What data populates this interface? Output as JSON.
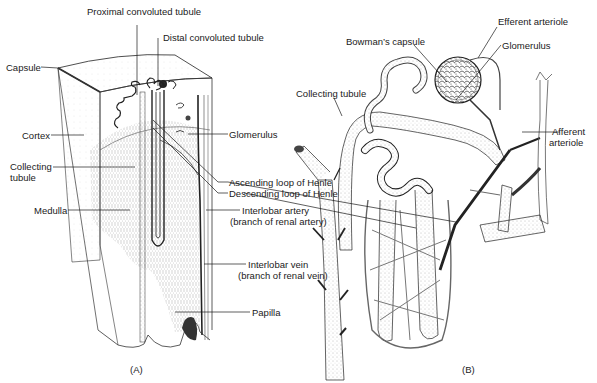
{
  "figure": {
    "panels": [
      {
        "id": "A",
        "label": "(A)",
        "description": "Cutaway of a kidney lobe showing cortex, medulla and nephron arrangement"
      },
      {
        "id": "B",
        "label": "(B)",
        "description": "Single nephron with its blood supply"
      }
    ]
  },
  "panel_a": {
    "labels": {
      "proximal_convoluted_tubule": "Proximal convoluted tubule",
      "distal_convoluted_tubule": "Distal convoluted tubule",
      "capsule": "Capsule",
      "cortex": "Cortex",
      "glomerulus": "Glomerulus",
      "collecting_tubule_line1": "Collecting",
      "collecting_tubule_line2": "tubule",
      "ascending_loop": "Ascending loop of Henle",
      "descending_loop": "Descending loop of Henle",
      "medulla": "Medulla",
      "interlobar_artery_line1": "Interlobar artery",
      "interlobar_artery_line2": "(branch of renal artery)",
      "interlobar_vein_line1": "Interlobar vein",
      "interlobar_vein_line2": "(branch of renal vein)",
      "papilla": "Papilla"
    },
    "panel_label": "(A)"
  },
  "panel_b": {
    "labels": {
      "efferent_arteriole": "Efferent arteriole",
      "bowmans_capsule": "Bowman’s capsule",
      "glomerulus": "Glomerulus",
      "collecting_tubule": "Collecting tubule",
      "afferent_arteriole_line1": "Afferent",
      "afferent_arteriole_line2": "arteriole"
    },
    "panel_label": "(B)"
  },
  "colors": {
    "ink": "#1a1a1a",
    "stipple": "#9a9a9a",
    "background": "#ffffff"
  }
}
